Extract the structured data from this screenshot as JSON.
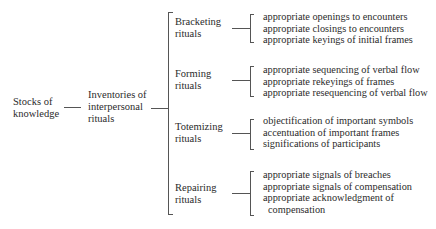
{
  "root": {
    "label_line1": "Stocks of",
    "label_line2": "knowledge"
  },
  "middle": {
    "label_line1": "Inventories of",
    "label_line2": "interpersonal",
    "label_line3": "rituals"
  },
  "branches": [
    {
      "line1": "Bracketing",
      "line2": "rituals",
      "items": [
        "appropriate openings to encounters",
        "appropriate closings to encounters",
        "appropriate keyings of initial frames"
      ]
    },
    {
      "line1": "Forming",
      "line2": "rituals",
      "items": [
        "appropriate sequencing of verbal flow",
        "appropriate rekeyings of frames",
        "appropriate resequencing of verbal flow"
      ]
    },
    {
      "line1": "Totemizing",
      "line2": "rituals",
      "items": [
        "objectification of important symbols",
        "accentuation of important frames",
        "significations of participants"
      ]
    },
    {
      "line1": "Repairing",
      "line2": "rituals",
      "items": [
        "appropriate signals of breaches",
        "appropriate signals of compensation",
        "appropriate acknowledgment of",
        "compensation"
      ]
    }
  ]
}
